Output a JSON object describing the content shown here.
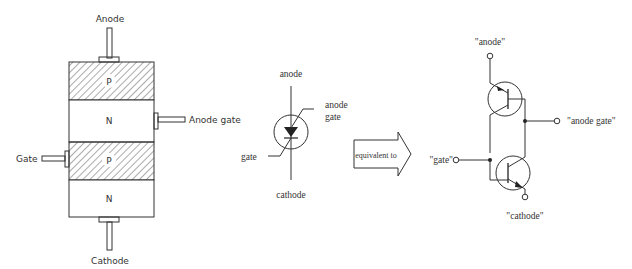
{
  "structure": {
    "terminals": {
      "anode": "Anode",
      "anode_gate": "Anode gate",
      "gate": "Gate",
      "cathode": "Cathode"
    },
    "layers": [
      {
        "label": "P",
        "hatched": true
      },
      {
        "label": "N",
        "hatched": false
      },
      {
        "label": "P",
        "hatched": true
      },
      {
        "label": "N",
        "hatched": false
      }
    ]
  },
  "symbol": {
    "anode": "anode",
    "anode_gate_line1": "anode",
    "anode_gate_line2": "gate",
    "gate": "gate",
    "cathode": "cathode"
  },
  "arrow": {
    "label": "equivalent to"
  },
  "equivalent": {
    "anode": "\"anode\"",
    "anode_gate": "\"anode gate\"",
    "gate": "\"gate\"",
    "cathode": "\"cathode\""
  },
  "colors": {
    "line": "#333333",
    "background": "#ffffff"
  }
}
